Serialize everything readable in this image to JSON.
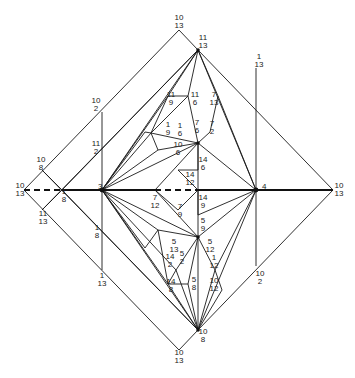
{
  "diagram": {
    "width": 355,
    "height": 378,
    "axis_solid": [
      [
        62,
        190
      ],
      [
        155,
        190
      ]
    ],
    "axis_solid2": [
      [
        198,
        190
      ],
      [
        333,
        190
      ]
    ],
    "axis_dashed": [
      [
        [
          24,
          190
        ],
        [
          62,
          190
        ]
      ],
      [
        [
          155,
          190
        ],
        [
          198,
          190
        ]
      ]
    ],
    "nodes": [
      {
        "id": "3",
        "x": 102,
        "y": 190,
        "label": "3",
        "dx": -4,
        "dy": -1
      },
      {
        "id": "4",
        "x": 256,
        "y": 190,
        "label": "4",
        "dx": 6,
        "dy": -1
      }
    ],
    "lines": [
      [
        [
          24,
          190
        ],
        [
          179,
          30
        ]
      ],
      [
        [
          179,
          30
        ],
        [
          198,
          50
        ]
      ],
      [
        [
          198,
          50
        ],
        [
          333,
          190
        ]
      ],
      [
        [
          24,
          190
        ],
        [
          179,
          350
        ]
      ],
      [
        [
          179,
          350
        ],
        [
          198,
          330
        ]
      ],
      [
        [
          198,
          330
        ],
        [
          333,
          190
        ]
      ],
      [
        [
          42,
          170
        ],
        [
          62,
          190
        ]
      ],
      [
        [
          62,
          190
        ],
        [
          42,
          210
        ]
      ],
      [
        [
          62,
          190
        ],
        [
          198,
          50
        ]
      ],
      [
        [
          62,
          190
        ],
        [
          198,
          330
        ]
      ],
      [
        [
          42,
          170
        ],
        [
          198,
          330
        ]
      ],
      [
        [
          42,
          210
        ],
        [
          198,
          50
        ]
      ],
      [
        [
          102,
          112
        ],
        [
          102,
          270
        ]
      ],
      [
        [
          256,
          68
        ],
        [
          256,
          266
        ]
      ],
      [
        [
          102,
          190
        ],
        [
          198,
          50
        ]
      ],
      [
        [
          102,
          190
        ],
        [
          168,
          96
        ]
      ],
      [
        [
          102,
          190
        ],
        [
          145,
          132
        ]
      ],
      [
        [
          102,
          190
        ],
        [
          151,
          133
        ]
      ],
      [
        [
          102,
          190
        ],
        [
          158,
          150
        ]
      ],
      [
        [
          102,
          190
        ],
        [
          198,
          143
        ]
      ],
      [
        [
          102,
          190
        ],
        [
          198,
          330
        ]
      ],
      [
        [
          102,
          190
        ],
        [
          168,
          284
        ]
      ],
      [
        [
          102,
          190
        ],
        [
          145,
          248
        ]
      ],
      [
        [
          102,
          190
        ],
        [
          158,
          230
        ]
      ],
      [
        [
          102,
          190
        ],
        [
          198,
          237
        ]
      ],
      [
        [
          102,
          190
        ],
        [
          176,
          270
        ]
      ],
      [
        [
          256,
          190
        ],
        [
          198,
          50
        ]
      ],
      [
        [
          256,
          190
        ],
        [
          198,
          330
        ]
      ],
      [
        [
          256,
          190
        ],
        [
          218,
          96
        ]
      ],
      [
        [
          256,
          190
        ],
        [
          198,
          143
        ]
      ],
      [
        [
          256,
          190
        ],
        [
          198,
          237
        ]
      ],
      [
        [
          256,
          190
        ],
        [
          215,
          270
        ]
      ],
      [
        [
          168,
          96
        ],
        [
          198,
          50
        ]
      ],
      [
        [
          168,
          96
        ],
        [
          188,
          96
        ]
      ],
      [
        [
          188,
          96
        ],
        [
          198,
          50
        ]
      ],
      [
        [
          188,
          96
        ],
        [
          198,
          143
        ]
      ],
      [
        [
          218,
          96
        ],
        [
          198,
          50
        ]
      ],
      [
        [
          218,
          96
        ],
        [
          210,
          132
        ]
      ],
      [
        [
          210,
          132
        ],
        [
          198,
          143
        ]
      ],
      [
        [
          145,
          132
        ],
        [
          151,
          133
        ]
      ],
      [
        [
          151,
          133
        ],
        [
          168,
          96
        ]
      ],
      [
        [
          151,
          133
        ],
        [
          188,
          96
        ]
      ],
      [
        [
          151,
          133
        ],
        [
          158,
          150
        ]
      ],
      [
        [
          158,
          150
        ],
        [
          198,
          143
        ]
      ],
      [
        [
          151,
          133
        ],
        [
          198,
          143
        ]
      ],
      [
        [
          198,
          143
        ],
        [
          198,
          170
        ]
      ],
      [
        [
          198,
          143
        ],
        [
          155,
          190
        ]
      ],
      [
        [
          178,
          170
        ],
        [
          198,
          190
        ]
      ],
      [
        [
          178,
          170
        ],
        [
          198,
          170
        ]
      ],
      [
        [
          155,
          190
        ],
        [
          178,
          210
        ]
      ],
      [
        [
          178,
          210
        ],
        [
          198,
          190
        ]
      ],
      [
        [
          198,
          190
        ],
        [
          198,
          215
        ]
      ],
      [
        [
          198,
          215
        ],
        [
          256,
          190
        ]
      ],
      [
        [
          155,
          190
        ],
        [
          198,
          237
        ]
      ],
      [
        [
          198,
          237
        ],
        [
          198,
          330
        ]
      ],
      [
        [
          198,
          237
        ],
        [
          176,
          270
        ]
      ],
      [
        [
          198,
          237
        ],
        [
          215,
          270
        ]
      ],
      [
        [
          176,
          270
        ],
        [
          168,
          284
        ]
      ],
      [
        [
          168,
          284
        ],
        [
          198,
          330
        ]
      ],
      [
        [
          176,
          270
        ],
        [
          198,
          330
        ]
      ],
      [
        [
          215,
          270
        ],
        [
          198,
          330
        ]
      ],
      [
        [
          215,
          270
        ],
        [
          222,
          290
        ]
      ],
      [
        [
          222,
          290
        ],
        [
          198,
          330
        ]
      ],
      [
        [
          158,
          230
        ],
        [
          198,
          237
        ]
      ],
      [
        [
          158,
          230
        ],
        [
          168,
          284
        ]
      ],
      [
        [
          145,
          248
        ],
        [
          158,
          230
        ]
      ],
      [
        [
          168,
          284
        ],
        [
          188,
          284
        ]
      ],
      [
        [
          188,
          284
        ],
        [
          198,
          237
        ]
      ],
      [
        [
          188,
          284
        ],
        [
          198,
          330
        ]
      ],
      [
        [
          198,
          143
        ],
        [
          198,
          190
        ]
      ],
      [
        [
          198,
          237
        ],
        [
          198,
          190
        ]
      ]
    ],
    "labels": [
      {
        "x": 179,
        "y": 20,
        "top": "10",
        "bot": "13"
      },
      {
        "x": 203,
        "y": 40,
        "top": "11",
        "bot": "13"
      },
      {
        "x": 96,
        "y": 103,
        "top": "10",
        "bot": "2"
      },
      {
        "x": 96,
        "y": 146,
        "top": "11",
        "bot": "2"
      },
      {
        "x": 41,
        "y": 162,
        "top": "10",
        "bot": "8"
      },
      {
        "x": 20,
        "y": 188,
        "top": "10",
        "bot": "13"
      },
      {
        "x": 64,
        "y": 194,
        "top": "1",
        "bot": "8"
      },
      {
        "x": 43,
        "y": 216,
        "top": "11",
        "bot": "13"
      },
      {
        "x": 97,
        "y": 230,
        "top": "1",
        "bot": "8"
      },
      {
        "x": 102,
        "y": 278,
        "top": "1",
        "bot": "13"
      },
      {
        "x": 259,
        "y": 59,
        "top": "1",
        "bot": "13"
      },
      {
        "x": 339,
        "y": 188,
        "top": "10",
        "bot": "13"
      },
      {
        "x": 260,
        "y": 276,
        "top": "10",
        "bot": "2"
      },
      {
        "x": 171,
        "y": 97,
        "top": "11",
        "bot": "9"
      },
      {
        "x": 195,
        "y": 97,
        "top": "11",
        "bot": "6"
      },
      {
        "x": 214,
        "y": 97,
        "top": "7",
        "bot": "13"
      },
      {
        "x": 168,
        "y": 127,
        "top": "1",
        "bot": "9"
      },
      {
        "x": 180,
        "y": 128,
        "top": "1",
        "bot": "6"
      },
      {
        "x": 197,
        "y": 125,
        "top": "7",
        "bot": "6"
      },
      {
        "x": 212,
        "y": 126,
        "top": "7",
        "bot": "2"
      },
      {
        "x": 178,
        "y": 147,
        "top": "10",
        "bot": "6"
      },
      {
        "x": 203,
        "y": 162,
        "top": "14",
        "bot": "6"
      },
      {
        "x": 190,
        "y": 177,
        "top": "14",
        "bot": "12"
      },
      {
        "x": 155,
        "y": 200,
        "top": "7",
        "bot": "12"
      },
      {
        "x": 180,
        "y": 209,
        "top": "7",
        "bot": "9"
      },
      {
        "x": 203,
        "y": 200,
        "top": "14",
        "bot": "9"
      },
      {
        "x": 203,
        "y": 223,
        "top": "5",
        "bot": "9"
      },
      {
        "x": 174,
        "y": 244,
        "top": "5",
        "bot": "13"
      },
      {
        "x": 210,
        "y": 244,
        "top": "5",
        "bot": "12"
      },
      {
        "x": 170,
        "y": 259,
        "top": "14",
        "bot": "2"
      },
      {
        "x": 182,
        "y": 256,
        "top": "5",
        "bot": "2"
      },
      {
        "x": 214,
        "y": 260,
        "top": "1",
        "bot": "12"
      },
      {
        "x": 171,
        "y": 284,
        "top": "14",
        "bot": "8"
      },
      {
        "x": 194,
        "y": 282,
        "top": "5",
        "bot": "8"
      },
      {
        "x": 214,
        "y": 283,
        "top": "10",
        "bot": "12"
      },
      {
        "x": 203,
        "y": 334,
        "top": "10",
        "bot": "8"
      },
      {
        "x": 179,
        "y": 355,
        "top": "10",
        "bot": "13"
      }
    ]
  }
}
